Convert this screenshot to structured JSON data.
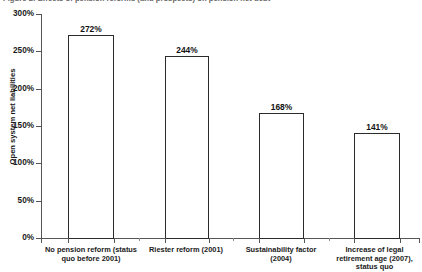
{
  "caption": {
    "text": "Figure 2: Effects of pension reforms (and prospects) on pension net debt"
  },
  "chart_data": {
    "type": "bar",
    "title": "",
    "xlabel": "",
    "ylabel": "Open system net liabilities",
    "categories": [
      "No pension reform (status quo before 2001)",
      "Riester reform (2001)",
      "Sustainability factor (2004)",
      "Increase of legal retirement age (2007), status quo"
    ],
    "values": [
      272,
      244,
      168,
      141
    ],
    "value_labels": [
      "272%",
      "244%",
      "168%",
      "141%"
    ],
    "ylim": [
      0,
      300
    ],
    "ytick_values": [
      0,
      50,
      100,
      150,
      200,
      250,
      300
    ],
    "ytick_labels": [
      "0%",
      "50%",
      "100%",
      "150%",
      "200%",
      "250%",
      "300%"
    ],
    "grid": false,
    "legend": "none",
    "bar_fill": "#ffffff",
    "bar_edge": "#2b2b2b",
    "axis_color": "#555555",
    "background": "#ffffff"
  }
}
